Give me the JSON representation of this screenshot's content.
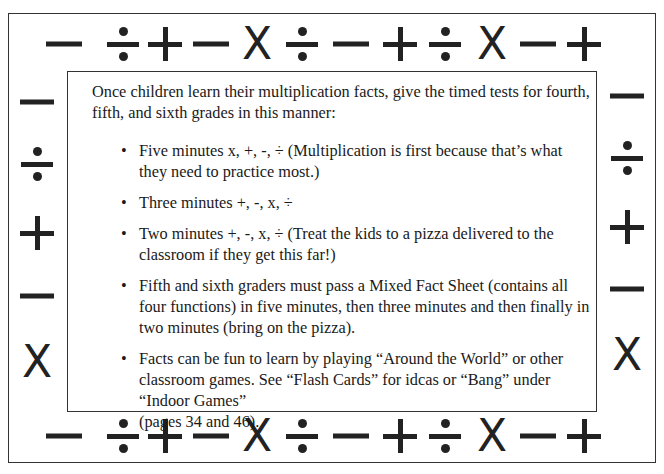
{
  "border_symbols": {
    "top": [
      {
        "type": "minus",
        "x": 64
      },
      {
        "type": "divide",
        "x": 123
      },
      {
        "type": "plus",
        "x": 165
      },
      {
        "type": "minus",
        "x": 211
      },
      {
        "type": "times",
        "x": 257,
        "glyph": "X"
      },
      {
        "type": "divide",
        "x": 302
      },
      {
        "type": "minus",
        "x": 351
      },
      {
        "type": "plus",
        "x": 400
      },
      {
        "type": "divide",
        "x": 445
      },
      {
        "type": "times",
        "x": 492,
        "glyph": "X"
      },
      {
        "type": "minus",
        "x": 538
      },
      {
        "type": "plus",
        "x": 584
      }
    ],
    "bottom": [
      {
        "type": "minus",
        "x": 64
      },
      {
        "type": "divide",
        "x": 123
      },
      {
        "type": "plus",
        "x": 165
      },
      {
        "type": "minus",
        "x": 211
      },
      {
        "type": "times",
        "x": 257,
        "glyph": "X"
      },
      {
        "type": "divide",
        "x": 302
      },
      {
        "type": "minus",
        "x": 351
      },
      {
        "type": "plus",
        "x": 400
      },
      {
        "type": "divide",
        "x": 445
      },
      {
        "type": "times",
        "x": 492,
        "glyph": "X"
      },
      {
        "type": "minus",
        "x": 538
      },
      {
        "type": "plus",
        "x": 584
      }
    ],
    "left": [
      {
        "type": "minus",
        "y": 102
      },
      {
        "type": "divide",
        "y": 164
      },
      {
        "type": "plus",
        "y": 233
      },
      {
        "type": "minus",
        "y": 296
      },
      {
        "type": "times",
        "y": 362,
        "glyph": "X"
      }
    ],
    "right": [
      {
        "type": "minus",
        "y": 96
      },
      {
        "type": "divide",
        "y": 158
      },
      {
        "type": "plus",
        "y": 227
      },
      {
        "type": "minus",
        "y": 289
      },
      {
        "type": "times",
        "y": 355,
        "glyph": "X"
      }
    ]
  },
  "content": {
    "intro": "Once children learn their multiplication facts, give the timed tests for fourth, fifth, and sixth grades in this manner:",
    "bullet_glyph": "•",
    "bullets": [
      {
        "text": "Five minutes x, +, -, ÷ (Multiplication is first because that’s what they need to practice most.)"
      },
      {
        "text": "Three minutes +, -, x, ÷"
      },
      {
        "text": "Two minutes +, -, x, ÷ (Treat the kids to a pizza delivered to the classroom if they get this far!)"
      },
      {
        "text": "Fifth and sixth graders must pass a Mixed Fact Sheet (contains all four functions) in five minutes, then three minutes and then finally in two minutes (bring on the pizza)."
      },
      {
        "lines": [
          "Facts can be fun to learn by playing “Around the World” or other classroom games.  See “Flash Cards” for idcas or “Bang” under",
          "“Indoor Games”",
          "(pages 34 and 46)."
        ]
      }
    ]
  }
}
